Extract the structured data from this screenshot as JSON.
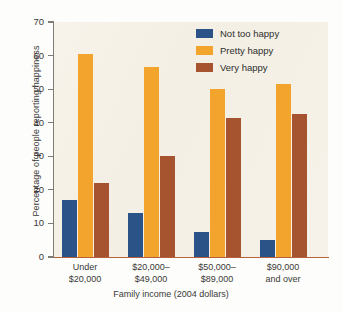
{
  "chart_data": {
    "type": "bar",
    "title": "",
    "xlabel": "Family income (2004 dollars)",
    "ylabel": "Percentage of people reporting happiness",
    "categories": [
      "Under\n$20,000",
      "$20,000–\n$49,000",
      "$50,000–\n$89,000",
      "$90,000\nand over"
    ],
    "category_lines": [
      [
        "Under",
        "$20,000"
      ],
      [
        "$20,000–",
        "$49,000"
      ],
      [
        "$50,000–",
        "$89,000"
      ],
      [
        "$90,000",
        "and over"
      ]
    ],
    "series": [
      {
        "name": "Not too happy",
        "color": "#2b5387",
        "values": [
          17,
          13,
          7.5,
          5
        ]
      },
      {
        "name": "Pretty happy",
        "color": "#f2a42c",
        "values": [
          60.5,
          56.5,
          50,
          51.5
        ]
      },
      {
        "name": "Very happy",
        "color": "#a65430",
        "values": [
          22,
          30,
          41.5,
          42.5
        ]
      }
    ],
    "ylim": [
      0,
      70
    ],
    "yticks": [
      0,
      10,
      20,
      30,
      40,
      50,
      60,
      70
    ],
    "ytick_labels": [
      "0",
      "10",
      "20",
      "30",
      "40",
      "50",
      "60",
      "70"
    ],
    "grid": false,
    "legend_position": "top-right",
    "plot_background": "#f5f1e7"
  },
  "legend": {
    "items": [
      {
        "label": "Not too happy",
        "color": "#2b5387"
      },
      {
        "label": "Pretty happy",
        "color": "#f2a42c"
      },
      {
        "label": "Very happy",
        "color": "#a65430"
      }
    ]
  }
}
